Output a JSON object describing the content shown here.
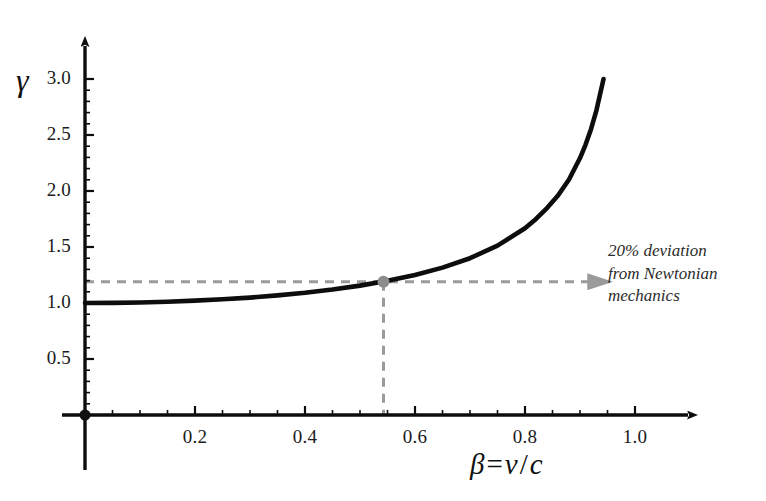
{
  "chart_data": {
    "type": "line",
    "title": "",
    "subtitle": "",
    "xlabel": "β = v/c",
    "ylabel": "γ",
    "xlim": [
      0,
      1.0
    ],
    "ylim": [
      0,
      3.0
    ],
    "grid": false,
    "legend_position": "none",
    "x_ticks": [
      "0.2",
      "0.4",
      "0.6",
      "0.8",
      "1.0"
    ],
    "x_tick_values": [
      0.2,
      0.4,
      0.6,
      0.8,
      1.0
    ],
    "x_minor_tick_values": [
      0.05,
      0.1,
      0.15,
      0.25,
      0.3,
      0.35,
      0.45,
      0.5,
      0.55,
      0.65,
      0.7,
      0.75,
      0.85,
      0.9,
      0.95
    ],
    "y_ticks": [
      "0.5",
      "1.0",
      "1.5",
      "2.0",
      "2.5",
      "3.0"
    ],
    "y_tick_values": [
      0.5,
      1.0,
      1.5,
      2.0,
      2.5,
      3.0
    ],
    "y_minor_tick_values": [
      0.1,
      0.2,
      0.3,
      0.4,
      0.6,
      0.7,
      0.8,
      0.9,
      1.1,
      1.2,
      1.3,
      1.4,
      1.6,
      1.7,
      1.8,
      1.9,
      2.1,
      2.2,
      2.3,
      2.4,
      2.6,
      2.7,
      2.8,
      2.9
    ],
    "series": [
      {
        "name": "Lorentz factor γ = 1/sqrt(1 - β²)",
        "color": "#0d0d0d",
        "x": [
          0.0,
          0.05,
          0.1,
          0.15,
          0.2,
          0.25,
          0.3,
          0.35,
          0.4,
          0.45,
          0.5,
          0.55,
          0.6,
          0.65,
          0.7,
          0.75,
          0.8,
          0.82,
          0.84,
          0.86,
          0.88,
          0.9,
          0.91,
          0.92,
          0.93,
          0.9428
        ],
        "y": [
          1.0,
          1.001,
          1.005,
          1.011,
          1.021,
          1.033,
          1.048,
          1.068,
          1.091,
          1.12,
          1.155,
          1.198,
          1.25,
          1.316,
          1.4,
          1.512,
          1.667,
          1.751,
          1.848,
          1.96,
          2.103,
          2.294,
          2.412,
          2.552,
          2.723,
          3.0
        ]
      }
    ],
    "markers": [
      {
        "name": "twenty-percent-deviation-point",
        "x": 0.5427,
        "y": 1.19,
        "color": "#8c8c8c",
        "radius": 6
      },
      {
        "name": "origin-point",
        "x": 0.0,
        "y": 0.0,
        "color": "#101010",
        "radius": 5.5
      }
    ],
    "guides": [
      {
        "name": "horizontal-deviation-guide",
        "orientation": "horizontal",
        "y": 1.19,
        "x_from": 0.0,
        "x_to": 0.915,
        "style": "dashed",
        "color": "#9a9a9a",
        "has_arrowhead": true
      },
      {
        "name": "vertical-deviation-guide",
        "orientation": "vertical",
        "x": 0.5427,
        "y_from": 0.0,
        "y_to": 1.19,
        "style": "dashed",
        "color": "#9a9a9a",
        "has_arrowhead": false
      }
    ],
    "annotations": [
      {
        "name": "deviation-annotation",
        "lines": [
          "20% deviation",
          "from Newtonian",
          "mechanics"
        ],
        "color": "#2b2b2b",
        "style": "italic"
      }
    ]
  },
  "axes": {
    "y_title": "γ",
    "x_title_beta": "β",
    "x_title_equals": "=",
    "x_title_v": "v",
    "x_title_slash": "/",
    "x_title_c": "c",
    "axis_color": "#0d0d0d"
  },
  "annotation": {
    "line1": "20% deviation",
    "line2": "from Newtonian",
    "line3": "mechanics"
  },
  "colors": {
    "curve": "#0d0d0d",
    "guide": "#9a9a9a",
    "marker": "#8c8c8c",
    "axis": "#0d0d0d",
    "text": "#1a1a1a",
    "background": "#ffffff"
  }
}
